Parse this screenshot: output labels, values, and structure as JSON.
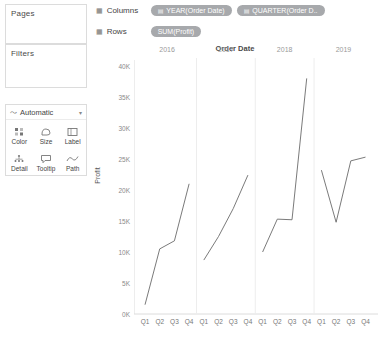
{
  "sidebar": {
    "pages": {
      "title": "Pages"
    },
    "filters": {
      "title": "Filters"
    },
    "marks": {
      "title": "Marks",
      "type_glyph": "〜",
      "type_label": "Automatic",
      "caret": "▾",
      "buttons": [
        {
          "name": "color",
          "label": "Color",
          "icon": "color-icon"
        },
        {
          "name": "size",
          "label": "Size",
          "icon": "size-icon"
        },
        {
          "name": "label",
          "label": "Label",
          "icon": "label-icon"
        },
        {
          "name": "detail",
          "label": "Detail",
          "icon": "detail-icon"
        },
        {
          "name": "tooltip",
          "label": "Tooltip",
          "icon": "tooltip-icon"
        },
        {
          "name": "path",
          "label": "Path",
          "icon": "path-icon"
        }
      ]
    }
  },
  "shelves": {
    "columns": {
      "label": "Columns",
      "icon": "grid-icon",
      "pills": [
        {
          "text": "YEAR(Order Date)",
          "icon": "calendar-icon"
        },
        {
          "text": "QUARTER(Order D..",
          "icon": "calendar-icon"
        }
      ]
    },
    "rows": {
      "label": "Rows",
      "icon": "grid-icon",
      "pills": [
        {
          "text": "SUM(Profit)",
          "icon": ""
        }
      ]
    }
  },
  "colors": {
    "pill_background": "#a7a9ac",
    "pill_text": "#ffffff",
    "line": "#6b6b6b",
    "axis": "#dcdcdc",
    "tick_text": "#8a8a8a"
  },
  "chart_data": {
    "type": "line",
    "title": "Order Date",
    "xlabel": "",
    "ylabel": "Profit",
    "ylim": [
      0,
      40000
    ],
    "ytick_labels": [
      "0K",
      "5K",
      "10K",
      "15K",
      "20K",
      "25K",
      "30K",
      "35K",
      "40K"
    ],
    "ytick_values": [
      0,
      5000,
      10000,
      15000,
      20000,
      25000,
      30000,
      35000,
      40000
    ],
    "grid": false,
    "legend": "none",
    "year_labels": [
      "2016",
      "2017",
      "2018",
      "2019"
    ],
    "quarter_labels": [
      "Q1",
      "Q2",
      "Q3",
      "Q4"
    ],
    "categories": [
      "2016 Q1",
      "2016 Q2",
      "2016 Q3",
      "2016 Q4",
      "2017 Q1",
      "2017 Q2",
      "2017 Q3",
      "2017 Q4",
      "2018 Q1",
      "2018 Q2",
      "2018 Q3",
      "2018 Q4",
      "2019 Q1",
      "2019 Q2",
      "2019 Q3",
      "2019 Q4"
    ],
    "series": [
      {
        "name": "SUM(Profit)",
        "break_by_year": true,
        "values": [
          1500,
          10500,
          11800,
          21000,
          8700,
          12500,
          17000,
          22400,
          10000,
          15300,
          15200,
          38000,
          23200,
          14800,
          24700,
          25300
        ]
      }
    ]
  }
}
